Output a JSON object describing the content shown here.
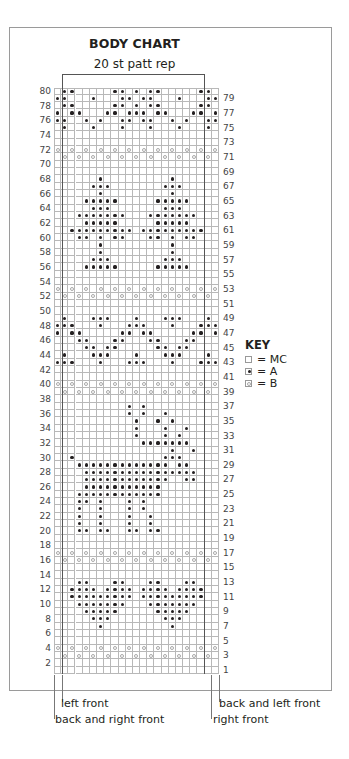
{
  "chart": {
    "title": "BODY CHART",
    "subtitle": "20 st patt rep",
    "columns": 23,
    "rows": 80,
    "rep_start_col": 1,
    "rep_end_col": 20
  },
  "key": {
    "title": "KEY",
    "items": [
      {
        "symbol": "empty",
        "label": "= MC"
      },
      {
        "symbol": "dot",
        "label": "= A"
      },
      {
        "symbol": "circle",
        "label": "= B"
      }
    ]
  },
  "footer": {
    "left_front": "left front",
    "back_and_right_front": "back and right front",
    "back_and_left_front": "back and left front",
    "right_front": "right front"
  },
  "chart_data": {
    "type": "heatmap",
    "title": "BODY CHART",
    "subtitle": "20 st patt rep",
    "legend": [
      "MC (blank)",
      "A (dot)",
      "B (circle)"
    ],
    "row_labels_left": [
      2,
      4,
      6,
      8,
      10,
      12,
      14,
      16,
      18,
      20,
      22,
      24,
      26,
      28,
      30,
      32,
      34,
      36,
      38,
      40,
      42,
      44,
      46,
      48,
      50,
      52,
      54,
      56,
      58,
      60,
      62,
      64,
      66,
      68,
      70,
      72,
      74,
      76,
      78,
      80
    ],
    "row_labels_right": [
      1,
      3,
      5,
      7,
      9,
      11,
      13,
      15,
      17,
      19,
      21,
      23,
      25,
      27,
      29,
      31,
      33,
      35,
      37,
      39,
      41,
      43,
      45,
      47,
      49,
      51,
      53,
      55,
      57,
      59,
      61,
      63,
      65,
      67,
      69,
      71,
      73,
      75,
      77,
      79
    ],
    "A_cells": {
      "80": [
        1,
        2,
        8,
        9,
        11,
        13,
        14,
        20,
        21
      ],
      "79": [
        0,
        1,
        5,
        9,
        10,
        12,
        13,
        17,
        21,
        22
      ],
      "78": [
        1,
        2,
        8,
        9,
        11,
        13,
        14,
        20,
        21
      ],
      "77": [
        0,
        2,
        3,
        7,
        8,
        10,
        11,
        12,
        14,
        15,
        19,
        20,
        22
      ],
      "76": [
        0,
        1,
        4,
        6,
        9,
        10,
        12,
        13,
        16,
        18,
        21,
        22
      ],
      "75": [
        1,
        5,
        9,
        13,
        17,
        21
      ],
      "68": [
        6,
        16
      ],
      "67": [
        5,
        6,
        7,
        15,
        16,
        17
      ],
      "66": [
        6,
        16
      ],
      "65": [
        4,
        5,
        6,
        7,
        8,
        14,
        15,
        16,
        17,
        18
      ],
      "64": [
        5,
        6,
        7,
        15,
        16,
        17
      ],
      "63": [
        3,
        4,
        5,
        6,
        7,
        8,
        9,
        13,
        14,
        15,
        16,
        17,
        18,
        19
      ],
      "62": [
        4,
        5,
        6,
        7,
        8,
        14,
        15,
        16,
        17,
        18
      ],
      "61": [
        2,
        3,
        4,
        5,
        6,
        7,
        8,
        9,
        10,
        12,
        13,
        14,
        15,
        16,
        17,
        18,
        19,
        20
      ],
      "60": [
        3,
        4,
        6,
        8,
        9,
        13,
        14,
        16,
        18,
        19
      ],
      "59": [
        6,
        16
      ],
      "58": [
        6,
        16
      ],
      "57": [
        5,
        6,
        7,
        15,
        16,
        17
      ],
      "56": [
        4,
        5,
        6,
        7,
        8,
        14,
        15,
        16,
        17,
        18
      ],
      "49": [
        1,
        5,
        6,
        7,
        11,
        15,
        16,
        17,
        21
      ],
      "48": [
        0,
        1,
        2,
        6,
        10,
        11,
        12,
        16,
        20,
        21,
        22
      ],
      "47": [
        0,
        2,
        3,
        9,
        10,
        12,
        13,
        19,
        20,
        22
      ],
      "46": [
        3,
        4,
        8,
        9,
        13,
        14,
        18,
        19
      ],
      "45": [
        4,
        5,
        7,
        8,
        14,
        15,
        17,
        18
      ],
      "44": [
        1,
        5,
        6,
        7,
        11,
        15,
        16,
        17,
        21
      ],
      "43": [
        0,
        1,
        2,
        6,
        10,
        11,
        12,
        16,
        20,
        21,
        22
      ],
      "37": [
        10,
        12
      ],
      "36": [
        10,
        12,
        15
      ],
      "35": [
        11,
        14,
        16
      ],
      "34": [
        11,
        15,
        18
      ],
      "33": [
        11,
        15,
        17
      ],
      "32": [
        12,
        13,
        14,
        15,
        16,
        17,
        18
      ],
      "31": [
        16,
        19
      ],
      "30": [
        2,
        15,
        16,
        17
      ],
      "29": [
        3,
        4,
        5,
        6,
        7,
        8,
        9,
        10,
        11,
        12,
        13,
        14,
        15,
        17,
        18
      ],
      "28": [
        4,
        5,
        6,
        7,
        8,
        9,
        10,
        11,
        12,
        13,
        14,
        15,
        16,
        17,
        18,
        19
      ],
      "27": [
        4,
        5,
        6,
        7,
        8,
        9,
        10,
        11,
        12,
        13,
        14,
        15,
        18,
        19
      ],
      "26": [
        4,
        5,
        6,
        7,
        8,
        9,
        10,
        11,
        12,
        13,
        14
      ],
      "25": [
        3,
        4,
        5,
        6,
        7,
        8,
        9,
        10,
        11,
        12,
        13,
        14
      ],
      "24": [
        3,
        4,
        6,
        10,
        12
      ],
      "23": [
        3,
        6,
        10,
        12
      ],
      "22": [
        3,
        6,
        10,
        13
      ],
      "21": [
        3,
        6,
        10,
        13
      ],
      "20": [
        3,
        4,
        6,
        7,
        10,
        11,
        13,
        14
      ],
      "13": [
        3,
        4,
        8,
        9,
        13,
        14,
        18,
        19
      ],
      "12": [
        2,
        3,
        4,
        5,
        7,
        8,
        9,
        10,
        12,
        13,
        14,
        15,
        17,
        18,
        19,
        20
      ],
      "11": [
        2,
        3,
        4,
        5,
        6,
        7,
        8,
        9,
        10,
        12,
        13,
        14,
        15,
        16,
        17,
        18,
        19,
        20
      ],
      "10": [
        3,
        4,
        5,
        6,
        7,
        8,
        9,
        13,
        14,
        15,
        16,
        17,
        18,
        19
      ],
      "9": [
        4,
        5,
        6,
        7,
        8,
        14,
        15,
        16,
        17,
        18
      ],
      "8": [
        5,
        6,
        7,
        15,
        16,
        17
      ],
      "7": [
        6,
        16
      ]
    },
    "B_rows_even_cols": [
      72,
      53,
      40,
      17,
      4
    ],
    "B_rows_odd_cols": [
      71,
      52,
      39,
      16,
      3
    ]
  }
}
